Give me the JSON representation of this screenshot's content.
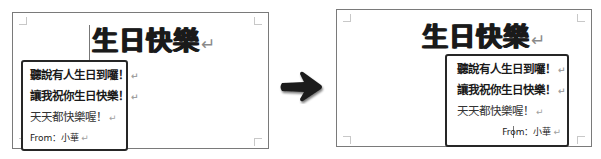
{
  "before": {
    "title": "生日快樂",
    "paragraph_mark": "↵",
    "textbox_lines": [
      {
        "text": "聽說有人生日到囉！",
        "style": "bold"
      },
      {
        "text": "讓我祝你生日快樂！",
        "style": "bold"
      },
      {
        "text": "天天都快樂喔！",
        "style": "regular"
      },
      {
        "text": "From：小華",
        "style": "small"
      }
    ],
    "textbox_alignment": "left"
  },
  "transition": {
    "icon": "arrow-right-icon",
    "color": "#1a1a1a"
  },
  "after": {
    "title": "生日快樂",
    "paragraph_mark": "↵",
    "textbox_lines": [
      {
        "text": "聽說有人生日到囉！",
        "style": "bold"
      },
      {
        "text": "讓我祝你生日快樂！",
        "style": "bold"
      },
      {
        "text": "天天都快樂喔！",
        "style": "regular"
      },
      {
        "text": "From：小華",
        "style": "small"
      }
    ],
    "textbox_alignment": "right"
  }
}
